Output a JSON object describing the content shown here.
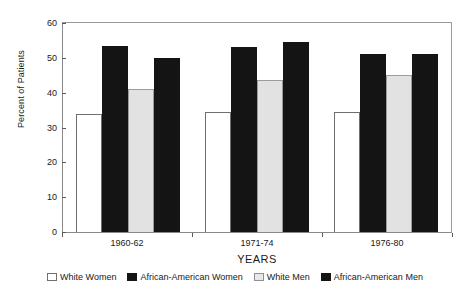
{
  "chart_data": {
    "type": "bar",
    "title": "",
    "xlabel": "YEARS",
    "ylabel": "Percent of Patients",
    "ylim": [
      0,
      60
    ],
    "yticks": [
      0,
      10,
      20,
      30,
      40,
      50,
      60
    ],
    "grid": false,
    "legend_position": "bottom",
    "categories": [
      "1960-62",
      "1971-74",
      "1976-80"
    ],
    "series": [
      {
        "name": "White Women",
        "style": "white",
        "color": "#ffffff",
        "values": [
          34,
          34.5,
          34.5
        ]
      },
      {
        "name": "African-American Women",
        "style": "black",
        "color": "#141414",
        "values": [
          53.5,
          53,
          51
        ]
      },
      {
        "name": "White Men",
        "style": "gray",
        "color": "#e2e2e2",
        "values": [
          41,
          43.5,
          45
        ]
      },
      {
        "name": "African-American Men",
        "style": "black",
        "color": "#141414",
        "values": [
          50,
          54.5,
          51
        ]
      }
    ]
  }
}
